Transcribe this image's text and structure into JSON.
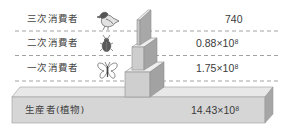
{
  "diagram": {
    "type": "ecological-pyramid",
    "levels": [
      {
        "label": "三次消費者",
        "icon": "bird-icon",
        "value": "740"
      },
      {
        "label": "二次消費者",
        "icon": "beetle-icon",
        "value": "0.88×10⁸"
      },
      {
        "label": "一次消費者",
        "icon": "butterfly-icon",
        "value": "1.75×10⁸"
      }
    ],
    "producer": {
      "label": "生産者(植物)",
      "value": "14.43×10⁸"
    },
    "colors": {
      "block_front": "#d6d6d6",
      "block_top": "#e8e8e8",
      "block_side": "#a6a6a6",
      "dashed_line": "#8a8a8a",
      "text": "#3a3a3a"
    }
  }
}
